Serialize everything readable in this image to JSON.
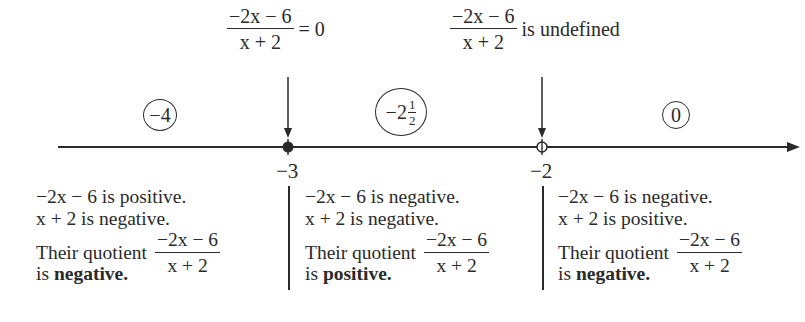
{
  "expression": {
    "numerator": "−2x − 6",
    "denominator": "x + 2"
  },
  "top_labels": [
    {
      "id": "zero",
      "suffix": "= 0",
      "x_value": -3
    },
    {
      "id": "undefined",
      "suffix": "is undefined",
      "x_value": -2
    }
  ],
  "test_points": [
    {
      "label": "−4",
      "whole": "",
      "fraction": null
    },
    {
      "label": "",
      "whole": "−2",
      "fraction": {
        "numerator": "1",
        "denominator": "2"
      }
    },
    {
      "label": "0",
      "whole": "",
      "fraction": null
    }
  ],
  "number_line": {
    "points": [
      {
        "value": "−3",
        "marker": "closed-dot"
      },
      {
        "value": "−2",
        "marker": "open-circle"
      }
    ],
    "direction": "arrow-right"
  },
  "intervals": [
    {
      "line1": "−2x − 6 is positive.",
      "line2": "x + 2 is negative.",
      "quotient_prefix": "Their quotient",
      "result_prefix": "is",
      "result": "negative."
    },
    {
      "line1": "−2x − 6 is negative.",
      "line2": "x + 2 is negative.",
      "quotient_prefix": "Their quotient",
      "result_prefix": "is",
      "result": "positive."
    },
    {
      "line1": "−2x − 6 is negative.",
      "line2": "x + 2 is positive.",
      "quotient_prefix": "Their quotient",
      "result_prefix": "is",
      "result": "negative."
    }
  ]
}
